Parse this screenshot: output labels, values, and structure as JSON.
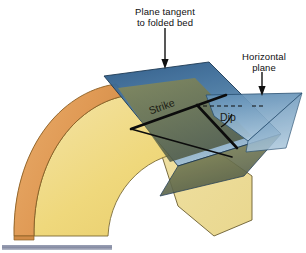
{
  "figure": {
    "background_color": "#ffffff",
    "width": 306,
    "height": 253
  },
  "labels": {
    "tangent_plane": "Plane tangent\nto folded bed",
    "horizontal_plane": "Horizontal\nplane",
    "strike": "Strike",
    "dip": "Dip"
  },
  "colors": {
    "outer_bed_orange": "#e2a05c",
    "outer_bed_orange_dark": "#cf8740",
    "inner_bed_yellow": "#f0d87a",
    "inner_bed_yellow_light": "#f5e3a0",
    "end_face_pale": "#efdd9b",
    "tangent_plane_blue_dark": "#2f5f8d",
    "tangent_plane_blue_light": "#8fb4cf",
    "horizontal_plane_blue": "#7ea6c6",
    "overlap_olive": "#7b7f55",
    "overlap_olive_dark": "#4d5744",
    "outline_black": "#101010",
    "caption_bar_gray": "#8a90a6"
  },
  "elements": {
    "fold_type": "anticline",
    "strike_line": "thick black line along plane of tangency",
    "dip_line": "thick black line down-dip",
    "dip_reference": "dashed horizontal reference line",
    "dip_angle_arc": "arc between dip line and horizontal reference"
  },
  "arrows": {
    "tangent_arrow": "down-arrow from tangent plane label to blue plane crest",
    "horizontal_arrow": "down-arrow from horizontal plane label to light blue plane"
  }
}
